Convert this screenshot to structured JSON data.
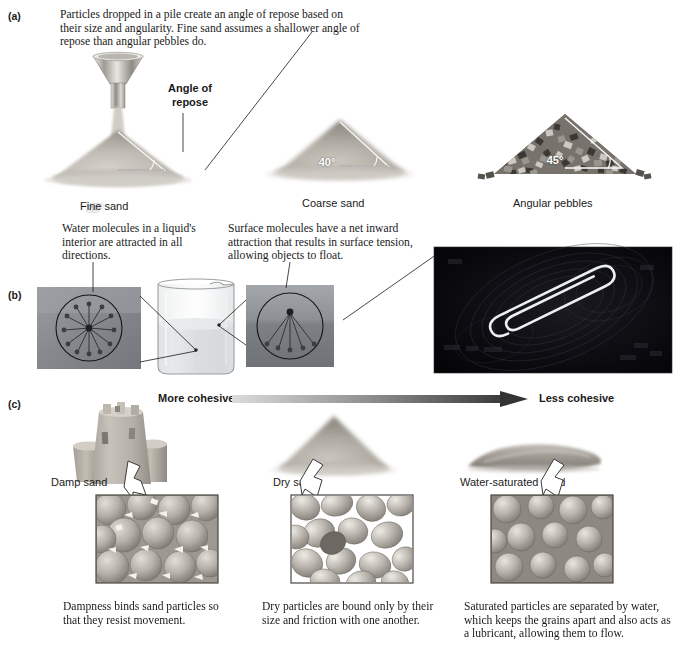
{
  "figure": {
    "panels": [
      {
        "id": "a",
        "label": "(a)"
      },
      {
        "id": "b",
        "label": "(b)"
      },
      {
        "id": "c",
        "label": "(c)"
      }
    ]
  },
  "panel_a": {
    "label": "(a)",
    "caption": "Particles dropped in a pile create an angle of repose based on their size and angularity. Fine sand assumes a shallower angle of repose than angular pebbles do.",
    "annotation": "Angle of\nrepose",
    "annotation_line1": "Angle of",
    "annotation_line2": "repose",
    "piles": [
      {
        "name": "Fine sand",
        "angle": "35°",
        "angle_value": 35,
        "texture": "fine"
      },
      {
        "name": "Coarse sand",
        "angle": "40°",
        "angle_value": 40,
        "texture": "coarse"
      },
      {
        "name": "Angular pebbles",
        "angle": "45°",
        "angle_value": 45,
        "texture": "pebbles"
      }
    ],
    "funnel_name": "funnel"
  },
  "panel_b": {
    "label": "(b)",
    "caption_left": "Water molecules in a liquid's interior are attracted in all directions.",
    "caption_right": "Surface molecules have a net inward attraction that results in surface tension, allowing objects to float.",
    "inset_left_name": "interior-molecule-inset",
    "inset_right_name": "surface-molecule-inset",
    "beaker_name": "beaker-of-water",
    "photo_name": "floating-paperclip-photo"
  },
  "panel_c": {
    "label": "(c)",
    "gradient_left_label": "More cohesive",
    "gradient_right_label": "Less cohesive",
    "items": [
      {
        "name": "Damp sand",
        "caption": "Dampness binds sand particles so that they resist movement.",
        "shape": "sandcastle"
      },
      {
        "name": "Dry  sand",
        "caption": "Dry particles are bound only by their size and friction with one another.",
        "shape": "cone-pile"
      },
      {
        "name": "Water-saturated sand",
        "caption": "Saturated particles are separated by water, which keeps the grains apart and also acts as a lubricant, allowing them to flow.",
        "shape": "flat-spread"
      }
    ]
  },
  "colors": {
    "ink": "#1a1a1a",
    "sand_light": "#d8d4cd",
    "sand_mid": "#b4afa6",
    "sand_dark": "#8d8880",
    "pebble_dark": "#4a4742",
    "photo_black": "#07070a",
    "inset_gray": "#8e9094",
    "gradient_start": "#d9d9d9",
    "gradient_end": "#3d3d3d"
  }
}
